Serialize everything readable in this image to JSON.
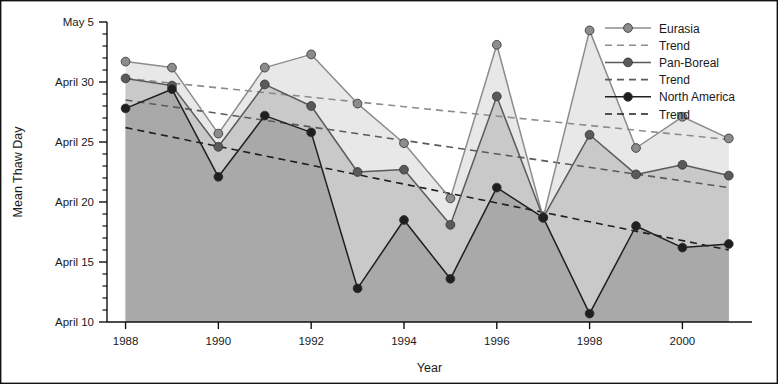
{
  "chart_data": {
    "type": "line",
    "title": "",
    "xlabel": "Year",
    "ylabel": "Mean Thaw Day",
    "x": [
      1988,
      1989,
      1990,
      1991,
      1992,
      1993,
      1994,
      1995,
      1996,
      1997,
      1998,
      1999,
      2000,
      2001
    ],
    "xlim": [
      1987.6,
      2001.5
    ],
    "ylim": [
      10,
      35
    ],
    "grid": false,
    "y_tick_labels": [
      "April 10",
      "April 15",
      "April 20",
      "April 25",
      "April 30",
      "May 5"
    ],
    "y_tick_values": [
      10,
      15,
      20,
      25,
      30,
      35
    ],
    "y_minor_step": 1,
    "x_tick_labels": [
      "1988",
      "1990",
      "1992",
      "1994",
      "1996",
      "1998",
      "2000"
    ],
    "x_tick_values": [
      1988,
      1990,
      1992,
      1994,
      1996,
      1998,
      2000
    ],
    "legend_position": "top-right",
    "series": [
      {
        "name": "Eurasia",
        "color": "#8c8c8c",
        "fill": "#e8e8e8",
        "values": [
          31.7,
          31.2,
          25.7,
          31.2,
          32.3,
          28.2,
          24.9,
          20.3,
          33.1,
          18.7,
          34.3,
          24.5,
          27.1,
          25.3
        ],
        "trend": {
          "name": "Trend",
          "start": 30.3,
          "end": 25.2,
          "color": "#8c8c8c"
        }
      },
      {
        "name": "Pan-Boreal",
        "color": "#5a5a5a",
        "fill": "#c9c9c9",
        "values": [
          30.3,
          29.7,
          24.6,
          29.8,
          28.0,
          22.5,
          22.7,
          18.1,
          28.8,
          18.7,
          25.6,
          22.3,
          23.1,
          22.2
        ],
        "trend": {
          "name": "Trend",
          "start": 28.5,
          "end": 21.2,
          "color": "#5a5a5a"
        }
      },
      {
        "name": "North America",
        "color": "#1f1f1f",
        "fill": "#a9a9a9",
        "values": [
          27.8,
          29.4,
          22.1,
          27.2,
          25.8,
          12.8,
          18.5,
          13.6,
          21.2,
          18.7,
          10.7,
          18.0,
          16.2,
          16.5
        ],
        "trend": {
          "name": "Trend",
          "start": 26.2,
          "end": 16.0,
          "color": "#1f1f1f"
        }
      }
    ],
    "legend_entries": [
      {
        "label": "Eurasia",
        "style": "marker-line",
        "color": "#8c8c8c"
      },
      {
        "label": "Trend",
        "style": "dashed",
        "color": "#8c8c8c"
      },
      {
        "label": "Pan-Boreal",
        "style": "marker-line",
        "color": "#5a5a5a"
      },
      {
        "label": "Trend",
        "style": "dashed",
        "color": "#5a5a5a"
      },
      {
        "label": "North America",
        "style": "marker-line",
        "color": "#1f1f1f"
      },
      {
        "label": "Trend",
        "style": "dashed",
        "color": "#1f1f1f"
      }
    ]
  }
}
